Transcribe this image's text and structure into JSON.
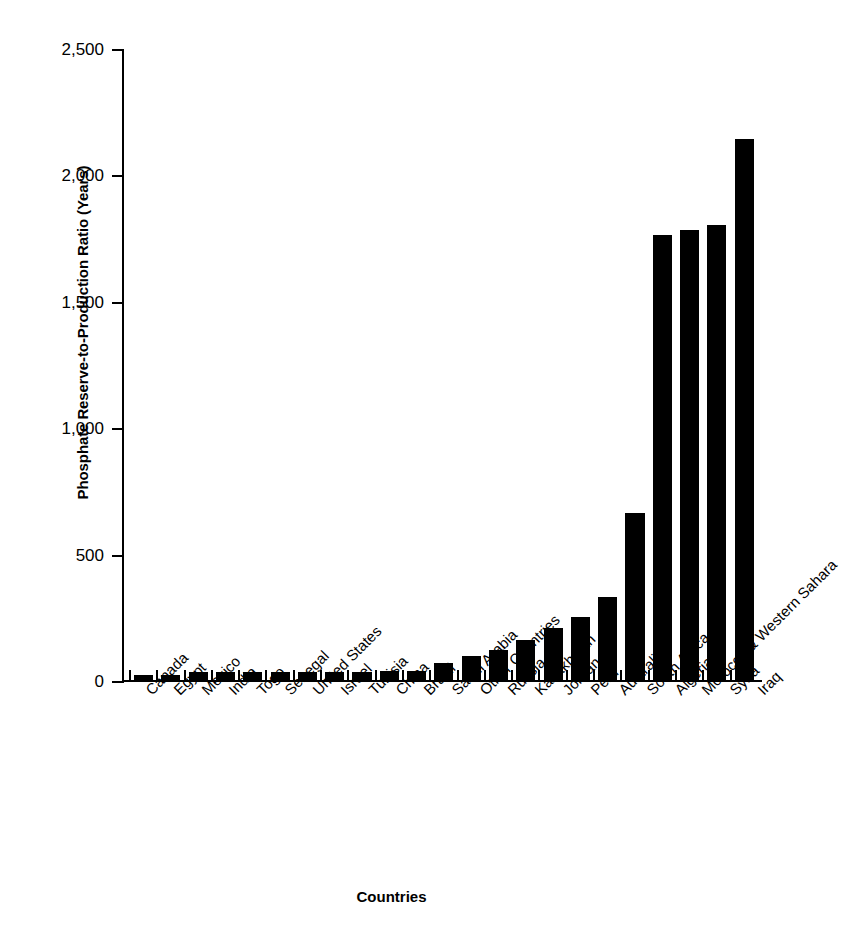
{
  "chart_data": {
    "type": "bar",
    "title": "",
    "xlabel": "Countries",
    "ylabel": "Phosphate Reserve-to-Production Ratio (Years)",
    "ylim": [
      0,
      2500
    ],
    "yticks": [
      0,
      500,
      1000,
      1500,
      2000,
      2500
    ],
    "ytick_labels": [
      "0",
      "500",
      "1,000",
      "1,500",
      "2,000",
      "2,500"
    ],
    "grid": false,
    "legend": "none",
    "bar_color": "#000000",
    "axis_color": "#000000",
    "categories": [
      "Canada",
      "Egypt",
      "Mexico",
      "India",
      "Togo",
      "Senegal",
      "United States",
      "Israel",
      "Tunisia",
      "China",
      "Brazil",
      "Saudi Arabia",
      "Other Countries",
      "Russia",
      "Kazakhstan",
      "Jordan",
      "Peru",
      "Australia",
      "South Africa",
      "Algeria",
      "Morocco & Western Sahara",
      "Syria",
      "Iraq"
    ],
    "values": [
      18,
      18,
      30,
      31,
      32,
      33,
      33,
      33,
      33,
      34,
      36,
      69,
      95,
      120,
      160,
      205,
      250,
      330,
      660,
      1760,
      1780,
      1800,
      2140
    ]
  }
}
